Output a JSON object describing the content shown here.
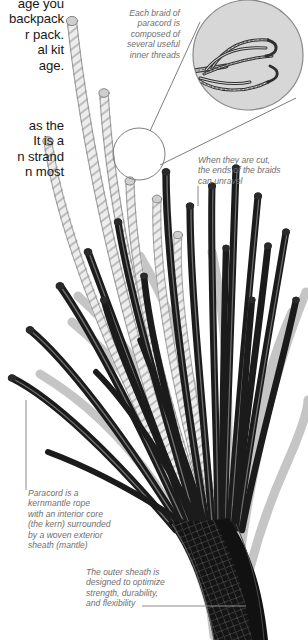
{
  "page": {
    "width": 308,
    "height": 640,
    "background": "#ffffff"
  },
  "colors": {
    "body_text": "#171717",
    "caption_text": "#6e6e6e",
    "cord_dark": "#1b1b1b",
    "cord_light": "#e9e9e9",
    "cord_light_stroke": "#8d8d8d",
    "shadow_gray": "#b9b9b9",
    "lens_fill": "#d8d8d8",
    "leader_line": "#8a8a8a"
  },
  "body_text": {
    "block_1": "age you\nbackpack\nr pack.\nal kit\nage.",
    "block_2": "as the\nIt is a\nn strand\nn most"
  },
  "captions": {
    "braid_threads": "Each braid of\nparacord is\ncomposed of\nseveral useful\ninner threads",
    "cut_ends": "When they are cut,\nthe ends of the braids\ncan unravel",
    "kernmantle": "Paracord is a\nkernmantle rope\nwith an interior core\n(the kern) surrounded\nby a woven exterior\nsheath (mantle)",
    "outer_sheath": "The outer sheath is\ndesigned to optimize\nstrength, durability,\nand flexibility"
  },
  "figure": {
    "magnifier_detail_label": "inner-threads-detail",
    "lens_center": [
      248,
      55
    ],
    "lens_radius": 55,
    "small_lens_center": [
      139,
      154
    ],
    "small_lens_radius": 26
  }
}
